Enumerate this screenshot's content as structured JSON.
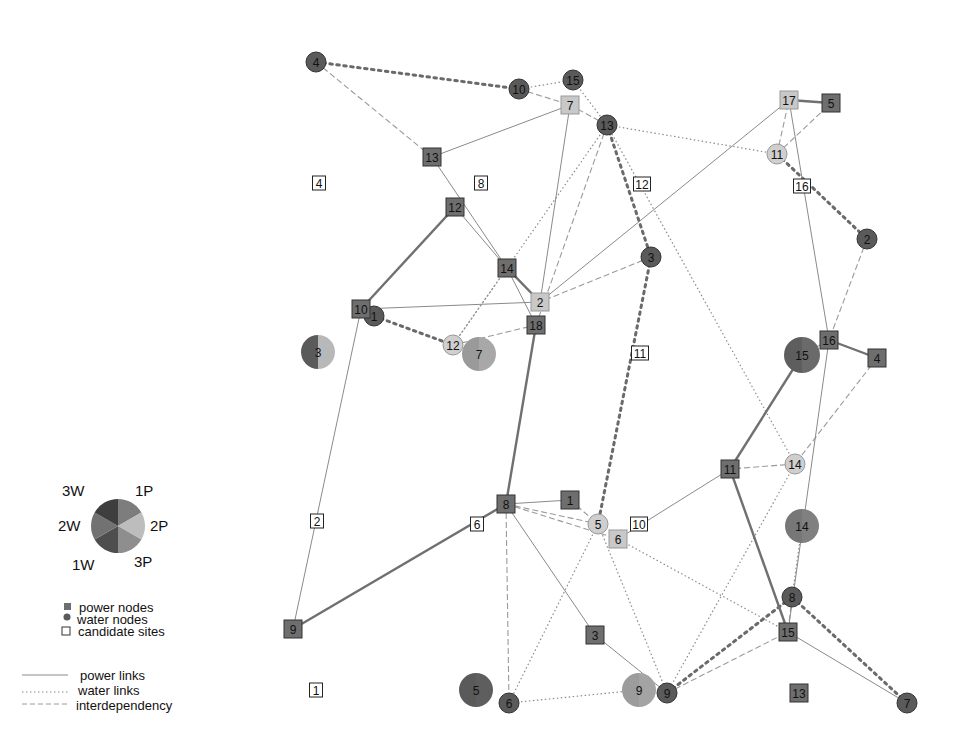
{
  "colors": {
    "power_node": "#6e6e6e",
    "power_node_light": "#c8c8c8",
    "water_node": "#5a5a5a",
    "water_node_light": "#cfcfcf",
    "candidate_fill": "#ffffff",
    "power_link": "#8a8a8a",
    "power_link_heavy": "#707070",
    "water_link": "#8c8c8c",
    "water_link_heavy": "#6a6a6a",
    "interdependency": "#9a9a9a"
  },
  "legend": {
    "pie": {
      "labels": [
        "3W",
        "1P",
        "2W",
        "2P",
        "1W",
        "3P"
      ],
      "slices": [
        {
          "name": "1P",
          "color": "#7d7d7d"
        },
        {
          "name": "2P",
          "color": "#bdbdbd"
        },
        {
          "name": "3P",
          "color": "#8e8e8e"
        },
        {
          "name": "1W",
          "color": "#4e4e4e"
        },
        {
          "name": "2W",
          "color": "#727272"
        },
        {
          "name": "3W",
          "color": "#3e3e3e"
        }
      ]
    },
    "node_types": [
      {
        "shape": "square",
        "label": "power nodes"
      },
      {
        "shape": "circle",
        "label": "water nodes"
      },
      {
        "shape": "candidate",
        "label": "candidate sites"
      }
    ],
    "link_types": [
      {
        "style": "solid",
        "label": "power links"
      },
      {
        "style": "dotted",
        "label": "water links"
      },
      {
        "style": "dashed",
        "label": "interdependency"
      }
    ]
  },
  "nodes": {
    "power": [
      {
        "id": "13",
        "x": 432,
        "y": 157,
        "shade": "dark"
      },
      {
        "id": "12",
        "x": 455,
        "y": 207,
        "shade": "dark"
      },
      {
        "id": "14",
        "x": 507,
        "y": 268,
        "shade": "dark"
      },
      {
        "id": "10",
        "x": 361,
        "y": 309,
        "shade": "dark"
      },
      {
        "id": "2",
        "x": 540,
        "y": 302,
        "shade": "light"
      },
      {
        "id": "18",
        "x": 536,
        "y": 325,
        "shade": "dark"
      },
      {
        "id": "7",
        "x": 570,
        "y": 105,
        "shade": "light"
      },
      {
        "id": "17",
        "x": 789,
        "y": 100,
        "shade": "light"
      },
      {
        "id": "5",
        "x": 831,
        "y": 103,
        "shade": "dark"
      },
      {
        "id": "16",
        "x": 829,
        "y": 340,
        "shade": "dark"
      },
      {
        "id": "4",
        "x": 877,
        "y": 358,
        "shade": "dark"
      },
      {
        "id": "11",
        "x": 730,
        "y": 469,
        "shade": "dark"
      },
      {
        "id": "8",
        "x": 506,
        "y": 504,
        "shade": "dark"
      },
      {
        "id": "1",
        "x": 570,
        "y": 500,
        "shade": "dark"
      },
      {
        "id": "6",
        "x": 618,
        "y": 539,
        "shade": "light"
      },
      {
        "id": "9",
        "x": 293,
        "y": 629,
        "shade": "dark"
      },
      {
        "id": "3",
        "x": 595,
        "y": 635,
        "shade": "dark"
      },
      {
        "id": "15",
        "x": 788,
        "y": 632,
        "shade": "dark"
      },
      {
        "id": "13b",
        "label": "13",
        "x": 799,
        "y": 693,
        "shade": "dark"
      }
    ],
    "water": [
      {
        "id": "4",
        "x": 316,
        "y": 62,
        "r": 10,
        "shade": "dark"
      },
      {
        "id": "10",
        "x": 519,
        "y": 89,
        "r": 10,
        "shade": "dark"
      },
      {
        "id": "15",
        "x": 573,
        "y": 80,
        "r": 10,
        "shade": "dark"
      },
      {
        "id": "13",
        "x": 607,
        "y": 125,
        "r": 10,
        "shade": "dark"
      },
      {
        "id": "11",
        "x": 777,
        "y": 154,
        "r": 10,
        "shade": "light"
      },
      {
        "id": "2",
        "x": 867,
        "y": 239,
        "r": 10,
        "shade": "dark"
      },
      {
        "id": "3",
        "x": 651,
        "y": 257,
        "r": 10,
        "shade": "dark"
      },
      {
        "id": "1",
        "x": 374,
        "y": 316,
        "r": 10,
        "shade": "dark"
      },
      {
        "id": "12",
        "x": 453,
        "y": 345,
        "r": 10,
        "shade": "light"
      },
      {
        "id": "14",
        "x": 795,
        "y": 464,
        "r": 10,
        "shade": "light"
      },
      {
        "id": "5",
        "x": 598,
        "y": 524,
        "r": 10,
        "shade": "light"
      },
      {
        "id": "8",
        "x": 792,
        "y": 597,
        "r": 10,
        "shade": "dark"
      },
      {
        "id": "6",
        "x": 509,
        "y": 703,
        "r": 10,
        "shade": "dark"
      },
      {
        "id": "9",
        "x": 667,
        "y": 693,
        "r": 10,
        "shade": "dark"
      },
      {
        "id": "7",
        "x": 907,
        "y": 703,
        "r": 10,
        "shade": "dark"
      }
    ],
    "pies": [
      {
        "id": "3",
        "x": 318,
        "y": 352,
        "r": 17,
        "left": "#5a5a5a",
        "right": "#b8b8b8"
      },
      {
        "id": "7",
        "x": 479,
        "y": 354,
        "r": 17,
        "left": "#9a9a9a",
        "right": "#a8a8a8"
      },
      {
        "id": "15",
        "x": 802,
        "y": 355,
        "r": 18,
        "left": "#5e5e5e",
        "right": "#6a6a6a"
      },
      {
        "id": "14",
        "x": 802,
        "y": 526,
        "r": 17,
        "left": "#777777",
        "right": "#808080"
      },
      {
        "id": "5",
        "x": 476,
        "y": 690,
        "r": 17,
        "left": "#5a5a5a",
        "right": "#5e5e5e"
      },
      {
        "id": "9",
        "x": 639,
        "y": 690,
        "r": 17,
        "left": "#9c9c9c",
        "right": "#a4a4a4"
      }
    ],
    "candidates": [
      {
        "id": "4",
        "x": 319,
        "y": 183
      },
      {
        "id": "8",
        "x": 481,
        "y": 183
      },
      {
        "id": "12",
        "x": 642,
        "y": 184
      },
      {
        "id": "16",
        "x": 802,
        "y": 186
      },
      {
        "id": "11",
        "x": 640,
        "y": 353
      },
      {
        "id": "2",
        "x": 317,
        "y": 521
      },
      {
        "id": "6",
        "x": 477,
        "y": 524
      },
      {
        "id": "10",
        "x": 639,
        "y": 524
      },
      {
        "id": "1",
        "x": 316,
        "y": 690
      }
    ]
  },
  "links": {
    "power": [
      [
        432,
        157,
        570,
        105
      ],
      [
        432,
        157,
        507,
        268
      ],
      [
        455,
        207,
        361,
        309
      ],
      [
        455,
        207,
        507,
        268
      ],
      [
        507,
        268,
        540,
        302
      ],
      [
        507,
        268,
        536,
        325
      ],
      [
        361,
        309,
        540,
        302
      ],
      [
        536,
        325,
        506,
        504
      ],
      [
        540,
        302,
        570,
        105
      ],
      [
        789,
        100,
        831,
        103
      ],
      [
        789,
        100,
        829,
        340
      ],
      [
        829,
        340,
        877,
        358
      ],
      [
        829,
        340,
        802,
        355
      ],
      [
        829,
        340,
        788,
        632
      ],
      [
        802,
        355,
        730,
        469
      ],
      [
        730,
        469,
        788,
        632
      ],
      [
        730,
        469,
        618,
        539
      ],
      [
        506,
        504,
        570,
        500
      ],
      [
        506,
        504,
        293,
        629
      ],
      [
        506,
        504,
        595,
        635
      ],
      [
        595,
        635,
        667,
        693
      ],
      [
        788,
        632,
        907,
        703
      ],
      [
        361,
        309,
        293,
        629
      ],
      [
        789,
        100,
        540,
        302
      ]
    ],
    "power_heavy": [
      [
        455,
        207,
        361,
        309
      ],
      [
        536,
        325,
        506,
        504
      ],
      [
        506,
        504,
        293,
        629
      ],
      [
        802,
        355,
        730,
        469
      ],
      [
        730,
        469,
        788,
        632
      ],
      [
        789,
        100,
        831,
        103
      ],
      [
        829,
        340,
        877,
        358
      ],
      [
        507,
        268,
        540,
        302
      ]
    ],
    "water": [
      [
        519,
        89,
        573,
        80
      ],
      [
        573,
        80,
        607,
        125
      ],
      [
        607,
        125,
        777,
        154
      ],
      [
        607,
        125,
        453,
        345
      ],
      [
        453,
        345,
        507,
        268
      ],
      [
        598,
        524,
        509,
        703
      ],
      [
        598,
        524,
        667,
        693
      ],
      [
        509,
        703,
        639,
        690
      ],
      [
        795,
        464,
        607,
        125
      ],
      [
        618,
        539,
        788,
        632
      ],
      [
        792,
        597,
        802,
        526
      ],
      [
        795,
        464,
        667,
        693
      ]
    ],
    "water_heavy": [
      [
        316,
        62,
        519,
        89
      ],
      [
        607,
        125,
        651,
        257
      ],
      [
        651,
        257,
        598,
        524
      ],
      [
        374,
        316,
        453,
        345
      ],
      [
        777,
        154,
        867,
        239
      ],
      [
        792,
        597,
        907,
        703
      ],
      [
        667,
        693,
        792,
        597
      ]
    ],
    "interdependency": [
      [
        316,
        62,
        432,
        157
      ],
      [
        519,
        89,
        570,
        105
      ],
      [
        570,
        105,
        607,
        125
      ],
      [
        607,
        125,
        536,
        325
      ],
      [
        777,
        154,
        789,
        100
      ],
      [
        777,
        154,
        831,
        103
      ],
      [
        867,
        239,
        829,
        340
      ],
      [
        651,
        257,
        540,
        302
      ],
      [
        453,
        345,
        536,
        325
      ],
      [
        877,
        358,
        795,
        464
      ],
      [
        795,
        464,
        730,
        469
      ],
      [
        506,
        504,
        598,
        524
      ],
      [
        506,
        504,
        618,
        539
      ],
      [
        570,
        500,
        598,
        524
      ],
      [
        506,
        504,
        509,
        703
      ],
      [
        667,
        693,
        788,
        632
      ],
      [
        792,
        597,
        788,
        632
      ]
    ]
  }
}
